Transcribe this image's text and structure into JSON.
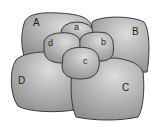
{
  "diagram": {
    "colors": {
      "fill_light": "#dcdcdc",
      "fill_mid": "#b0b0b0",
      "fill_dark": "#8e8e8e",
      "outline": "#3a3a3a",
      "label": "#1e1e1e",
      "background": "#ffffff"
    },
    "cells": [
      {
        "id": "A",
        "label": "A",
        "size": "large"
      },
      {
        "id": "B",
        "label": "B",
        "size": "large"
      },
      {
        "id": "D",
        "label": "D",
        "size": "large"
      },
      {
        "id": "C",
        "label": "C",
        "size": "large"
      },
      {
        "id": "a",
        "label": "a",
        "size": "small"
      },
      {
        "id": "d",
        "label": "d",
        "size": "small"
      },
      {
        "id": "b",
        "label": "b",
        "size": "small"
      },
      {
        "id": "c",
        "label": "c",
        "size": "small"
      }
    ]
  }
}
